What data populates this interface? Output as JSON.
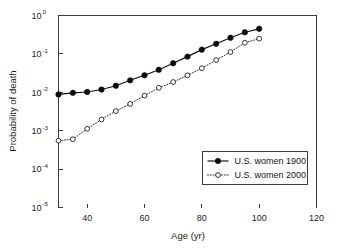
{
  "chart_data": {
    "type": "line",
    "title": "",
    "xlabel": "Age (yr)",
    "ylabel": "Probability of death",
    "xlim": [
      30,
      120
    ],
    "ylim": [
      1e-05,
      1
    ],
    "yscale": "log",
    "xscale": "linear",
    "grid": false,
    "legend_position": "lower right",
    "x_ticks": [
      40,
      60,
      80,
      100,
      120
    ],
    "x_tick_labels": [
      "40",
      "60",
      "80",
      "100",
      "120"
    ],
    "y_ticks": [
      1,
      0.1,
      0.01,
      0.001,
      0.0001,
      1e-05
    ],
    "y_tick_labels": [
      "10^0",
      "10^-1",
      "10^-2",
      "10^-3",
      "10^-4",
      "10^-5"
    ],
    "y_tick_bases": [
      "10",
      "10",
      "10",
      "10",
      "10",
      "10"
    ],
    "y_tick_exponents": [
      "0",
      "-1",
      "-2",
      "-3",
      "-4",
      "-5"
    ],
    "x": [
      30,
      35,
      40,
      45,
      50,
      55,
      60,
      65,
      70,
      75,
      80,
      85,
      90,
      95,
      100
    ],
    "series": [
      {
        "name": "U.S. women 1900",
        "marker": "filled-circle",
        "linestyle": "solid",
        "color": "#0b0b0b",
        "values": [
          0.0088,
          0.0097,
          0.0102,
          0.0118,
          0.0148,
          0.0205,
          0.0277,
          0.0385,
          0.057,
          0.085,
          0.129,
          0.183,
          0.263,
          0.365,
          0.45
        ]
      },
      {
        "name": "U.S. women 2000",
        "marker": "open-circle",
        "linestyle": "dotted",
        "color": "#202020",
        "values": [
          0.00055,
          0.0006,
          0.00112,
          0.00196,
          0.00325,
          0.005,
          0.0082,
          0.0131,
          0.0185,
          0.0277,
          0.0425,
          0.069,
          0.112,
          0.195,
          0.25
        ]
      }
    ]
  },
  "legend": {
    "entries": [
      {
        "label": "U.S. women 1900",
        "marker": "filled-circle",
        "linestyle": "solid"
      },
      {
        "label": "U.S. women 2000",
        "marker": "open-circle",
        "linestyle": "dotted"
      }
    ]
  },
  "colors": {
    "background": "#ffffff",
    "axis": "#3c3c3c",
    "series_1900": "#0b0b0b",
    "series_2000": "#202020",
    "text": "#1a1a1a"
  }
}
